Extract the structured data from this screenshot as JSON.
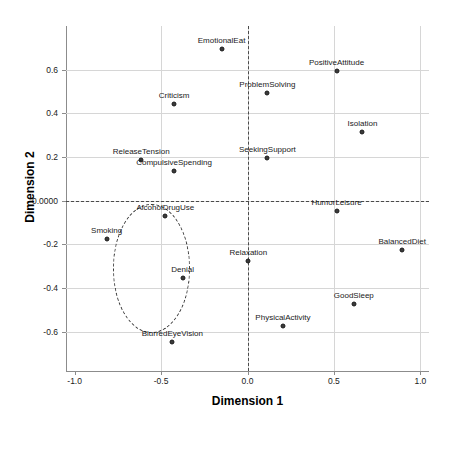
{
  "chart_data": {
    "type": "scatter",
    "title": "",
    "xlabel": "Dimension 1",
    "ylabel": "Dimension 2",
    "xlim": [
      -1.05,
      1.05
    ],
    "ylim": [
      -0.78,
      0.8
    ],
    "grid": true,
    "legend": "none",
    "xticks": [
      "-1.0",
      "-0.5",
      "0.0",
      "0.5",
      "1.0"
    ],
    "xtick_values": [
      -1.0,
      -0.5,
      0.0,
      0.5,
      1.0
    ],
    "yticks": [
      "0.6",
      "0.4",
      "0.2",
      "0.0000",
      "-0.2",
      "-0.4",
      "-0.6"
    ],
    "ytick_values": [
      0.6,
      0.4,
      0.2,
      0.0,
      -0.2,
      -0.4,
      -0.6
    ],
    "reference_lines": {
      "vertical_x": 0.0,
      "horizontal_y": 0.0,
      "style": "dashed"
    },
    "annotations": [
      {
        "name": "cluster-ellipse",
        "shape": "ellipse",
        "style": "dashed",
        "center_x": -0.555,
        "center_y": -0.31,
        "radius_x": 0.225,
        "radius_y": 0.295
      }
    ],
    "points": [
      {
        "label": "EmotionalEat",
        "x": -0.15,
        "y": 0.695
      },
      {
        "label": "PositiveAttitude",
        "x": 0.515,
        "y": 0.595
      },
      {
        "label": "Criticism",
        "x": -0.425,
        "y": 0.445
      },
      {
        "label": "ProblemSolving",
        "x": 0.115,
        "y": 0.495
      },
      {
        "label": "Isolation",
        "x": 0.665,
        "y": 0.315
      },
      {
        "label": "ReleaseTension",
        "x": -0.615,
        "y": 0.185
      },
      {
        "label": "CompulsiveSpending",
        "x": -0.425,
        "y": 0.135
      },
      {
        "label": "SeekingSupport",
        "x": 0.115,
        "y": 0.195
      },
      {
        "label": "AlcoholDrugUse",
        "x": -0.475,
        "y": -0.07
      },
      {
        "label": "HumorLeisure",
        "x": 0.515,
        "y": -0.045
      },
      {
        "label": "Smoking",
        "x": -0.815,
        "y": -0.175
      },
      {
        "label": "BalancedDiet",
        "x": 0.895,
        "y": -0.225
      },
      {
        "label": "Relaxation",
        "x": 0.005,
        "y": -0.275
      },
      {
        "label": "Denial",
        "x": -0.375,
        "y": -0.355
      },
      {
        "label": "GoodSleep",
        "x": 0.615,
        "y": -0.475
      },
      {
        "label": "PhysicalActivity",
        "x": 0.205,
        "y": -0.575
      },
      {
        "label": "BlurredEyeVision",
        "x": -0.435,
        "y": -0.645
      }
    ]
  }
}
